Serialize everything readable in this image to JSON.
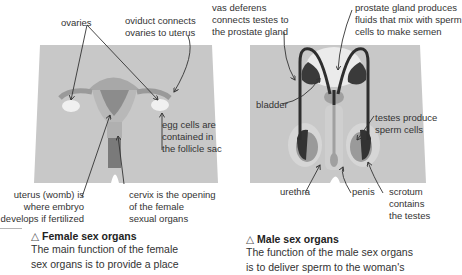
{
  "female": {
    "labels": {
      "ovaries": "ovaries",
      "oviduct": [
        "oviduct connects",
        "ovaries to uterus"
      ],
      "egg_cells": [
        "egg cells are",
        "contained in",
        "the follicle sac"
      ],
      "uterus": [
        "uterus (womb) is",
        "where embryo",
        "develops if fertilized"
      ],
      "cervix": [
        "cervix is the opening",
        "of the female",
        "sexual organs"
      ]
    },
    "caption": {
      "icon": "△",
      "title": "Female sex organs",
      "lines": [
        "The main function of the female",
        "sex organs is to provide a place"
      ]
    }
  },
  "male": {
    "labels": {
      "vas_deferens": [
        "vas deferens",
        "connects testes to",
        "the prostate gland"
      ],
      "prostate": [
        "prostate gland produces",
        "fluids that mix with sperm",
        "cells to make semen"
      ],
      "bladder": "bladder",
      "testes": [
        "testes produce",
        "sperm cells"
      ],
      "urethra": "urethra",
      "penis": "penis",
      "scrotum": [
        "scrotum",
        "contains",
        "the testes"
      ]
    },
    "caption": {
      "icon": "△",
      "title": "Male sex organs",
      "lines": [
        "The function of the male sex organs",
        "is to deliver sperm to the woman's"
      ]
    }
  },
  "colors": {
    "body": "#c8c8c8",
    "organ_light": "#b3b3b3",
    "organ_mid": "#8f8f8f",
    "organ_dark": "#3a3a3a",
    "highlight": "#eeeeee",
    "arrow": "#333333"
  }
}
